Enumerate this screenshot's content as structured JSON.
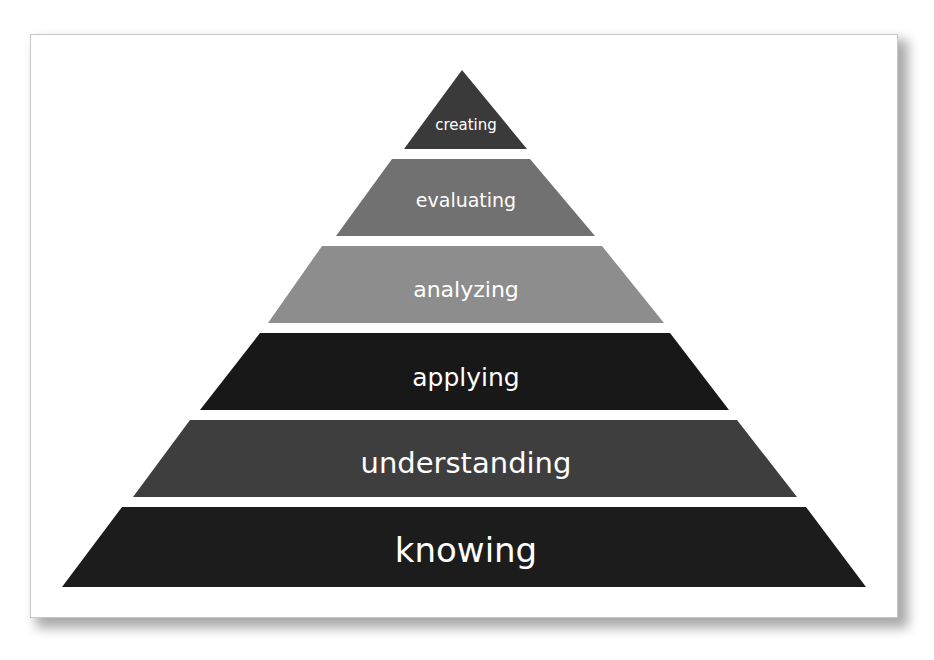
{
  "diagram": {
    "type": "pyramid",
    "tiers": [
      {
        "label": "creating",
        "color": "#3a3a3a",
        "font_size": 15,
        "points": "462,70 527,149 404,149",
        "label_x": 466,
        "label_y": 125
      },
      {
        "label": "evaluating",
        "color": "#717171",
        "font_size": 19,
        "points": "392,159 530,159 595,236 336,236",
        "label_x": 466,
        "label_y": 200
      },
      {
        "label": "analyzing",
        "color": "#8d8d8d",
        "font_size": 22,
        "points": "322,246 602,246 664,323 268,323",
        "label_x": 466,
        "label_y": 289
      },
      {
        "label": "applying",
        "color": "#181818",
        "font_size": 25,
        "points": "260,333 670,333 729,410 200,410",
        "label_x": 466,
        "label_y": 377
      },
      {
        "label": "understanding",
        "color": "#3e3e3e",
        "font_size": 29,
        "points": "190,420 737,420 797,497 133,497",
        "label_x": 466,
        "label_y": 463
      },
      {
        "label": "knowing",
        "color": "#1c1c1c",
        "font_size": 34,
        "points": "122,507 806,507 866,587 62,587",
        "label_x": 466,
        "label_y": 550
      }
    ]
  }
}
